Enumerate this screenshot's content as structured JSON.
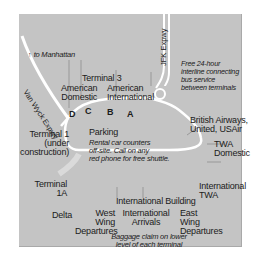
{
  "map": {
    "background": "#c4c4c4",
    "road_color": "#ffffff",
    "roads": {
      "van_wyck": "Van Wyck Expwy",
      "jfk": "JFK Expwy",
      "to_manhattan": "to Manhattan",
      "to_manhattan_arrow": "↑"
    },
    "terminals": {
      "terminal3": "Terminal 3",
      "american_domestic_1": "American",
      "american_domestic_2": "Domestic",
      "american_intl_1": "American",
      "american_intl_2": "International",
      "terminal1_1": "Terminal 1",
      "terminal1_2": "(under",
      "terminal1_3": "construction)",
      "terminal1a_1": "Terminal",
      "terminal1a_2": "1A",
      "delta": "Delta",
      "british_1": "British Airways,",
      "british_2": "United, USAir",
      "twa_dom_1": "TWA",
      "twa_dom_2": "Domestic",
      "twa_intl_1": "International",
      "twa_intl_2": "TWA",
      "intl_building": "International Building",
      "west_1": "West",
      "west_2": "Wing",
      "west_3": "Departures",
      "arrivals_1": "International",
      "arrivals_2": "Arrivals",
      "east_1": "East",
      "east_2": "Wing",
      "east_3": "Departures"
    },
    "gates": [
      "D",
      "C",
      "B",
      "A"
    ],
    "parking": {
      "title": "Parking",
      "note_1": "Rental car counters",
      "note_2": "off-site. Call on any",
      "note_3": "red phone for free shuttle."
    },
    "bus_note": {
      "line_1": "Free 24-hour",
      "line_2": "interline connecting",
      "line_3": "bus service",
      "line_4": "between terminals"
    },
    "baggage_note": {
      "line_1": "Baggage claim on lower",
      "line_2": "level of each terminal"
    }
  }
}
